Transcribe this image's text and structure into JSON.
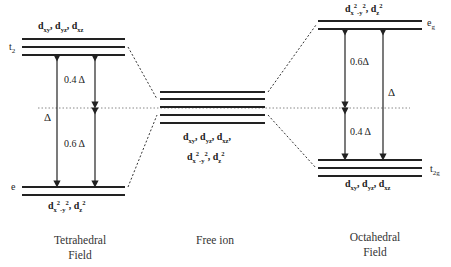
{
  "diagram": {
    "colors": {
      "line": "#222222",
      "dotted": "#888888",
      "background": "#ffffff"
    },
    "tetrahedral": {
      "caption_line1": "Tetrahedral",
      "caption_line2": "Field",
      "upper_set": {
        "label": "t",
        "label_sub": "2",
        "orbitals": [
          "xy",
          "yz",
          "xz"
        ],
        "line_count": 3
      },
      "lower_set": {
        "label": "e",
        "orbitals_text": "x2-y2, z2",
        "line_count": 2
      },
      "gap_upper": "0.4 Δ",
      "gap_lower": "0.6 Δ",
      "total": "Δ"
    },
    "free_ion": {
      "caption": "Free ion",
      "line_count": 5,
      "orbitals_line1": [
        "xy",
        "yz",
        "xz"
      ],
      "orbitals_line2": "x2-y2, z2"
    },
    "octahedral": {
      "caption_line1": "Octahedral",
      "caption_line2": "Field",
      "upper_set": {
        "label": "e",
        "label_sub": "g",
        "line_count": 2
      },
      "lower_set": {
        "label": "t",
        "label_sub": "2g",
        "orbitals": [
          "xy",
          "yz",
          "xz"
        ],
        "line_count": 3
      },
      "gap_upper": "0.6Δ",
      "gap_lower": "0.4 Δ",
      "total": "Δ"
    },
    "symbols": {
      "d": "d",
      "comma": ", ",
      "delta": "Δ",
      "two": "2"
    }
  }
}
